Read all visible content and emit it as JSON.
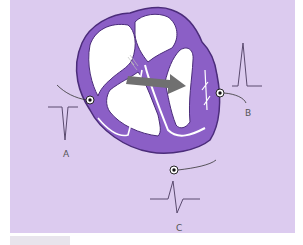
{
  "diagram": {
    "colors": {
      "background": "#dccbef",
      "heart_wall": "#8b5fc6",
      "heart_outline": "#4b2c7a",
      "chamber": "#ffffff",
      "arrow": "#707070",
      "trace": "#5a4a6e",
      "electrode": "#111111"
    },
    "electrodes": [
      {
        "id": "A",
        "label": "A",
        "deflection": "negative"
      },
      {
        "id": "B",
        "label": "B",
        "deflection": "positive"
      },
      {
        "id": "C",
        "label": "C",
        "deflection": "biphasic"
      }
    ],
    "arrow": {
      "label": "",
      "meaning": "mean electrical axis"
    }
  }
}
